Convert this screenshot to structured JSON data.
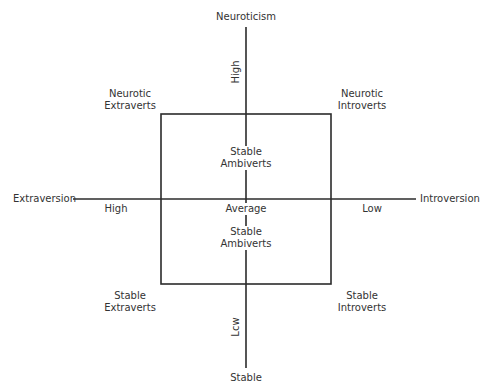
{
  "diagram": {
    "vertical_axis": {
      "top_label": "Neuroticism",
      "bottom_label": "Stable",
      "high_label": "High",
      "low_label": "Lcw"
    },
    "horizontal_axis": {
      "left_label": "Extraversion",
      "right_label": "Introversion",
      "high_label": "High",
      "low_label": "Low"
    },
    "center_label": "Average",
    "quadrants": {
      "top_left": [
        "Neurotic",
        "Extraverts"
      ],
      "top_right": [
        "Neurotic",
        "Introverts"
      ],
      "bottom_left": [
        "Stable",
        "Extraverts"
      ],
      "bottom_right": [
        "Stable",
        "Introverts"
      ]
    },
    "inner": {
      "upper": [
        "Stable",
        "Ambiverts"
      ],
      "lower": [
        "Stable",
        "Ambiverts"
      ]
    },
    "colors": {
      "line": "#2b2b2b",
      "text": "#333333",
      "background": "#ffffff"
    }
  }
}
